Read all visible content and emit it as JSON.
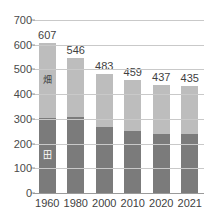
{
  "chart_data": {
    "type": "bar",
    "stacked": true,
    "title": "",
    "subtitle": "",
    "xlabel": "",
    "ylabel": "",
    "categories": [
      "1960",
      "1980",
      "2000",
      "2010",
      "2020",
      "2021"
    ],
    "series": [
      {
        "name": "田",
        "color": "#7b7b7b",
        "values": [
          304,
          308,
          267,
          251,
          239,
          238
        ]
      },
      {
        "name": "畑",
        "color": "#bdbdbd",
        "values": [
          303,
          238,
          216,
          208,
          198,
          197
        ]
      }
    ],
    "totals": [
      607,
      546,
      483,
      459,
      437,
      435
    ],
    "total_labels": [
      "607",
      "546",
      "483",
      "459",
      "437",
      "435"
    ],
    "ylim": [
      0,
      700
    ],
    "yticks": [
      0,
      100,
      200,
      300,
      400,
      500,
      600,
      700
    ],
    "ytick_labels": [
      "0",
      "100",
      "200",
      "300",
      "400",
      "500",
      "600",
      "700"
    ],
    "grid": true,
    "grid_color": "#c9c9c9",
    "legend": "none",
    "inline_labels": [
      {
        "series": "畑",
        "category": "1960",
        "text": "畑"
      },
      {
        "series": "田",
        "category": "1960",
        "text": "田"
      }
    ],
    "background": "#ffffff"
  }
}
